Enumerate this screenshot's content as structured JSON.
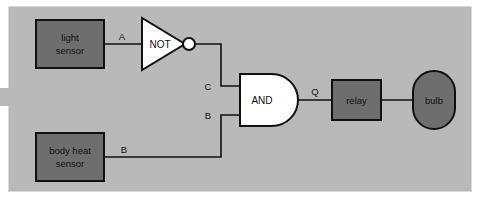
{
  "diagram": {
    "colors": {
      "panel_background": "#b9b9b9",
      "page_background": "#ffffff",
      "panel_border": "#d8d8d8",
      "component_fill": "#6e6e6e",
      "component_border": "#101010",
      "gate_fill": "#ffffff",
      "gate_border": "#101010",
      "wire": "#101010",
      "text": "#101010"
    },
    "components": {
      "light_sensor": {
        "label_line1": "light",
        "label_line2": "sensor"
      },
      "body_heat_sensor": {
        "label_line1": "body heat",
        "label_line2": "sensor"
      },
      "not_gate": {
        "label": "NOT"
      },
      "and_gate": {
        "label": "AND"
      },
      "relay": {
        "label": "relay"
      },
      "bulb": {
        "label": "bulb"
      }
    },
    "wire_labels": {
      "a": "A",
      "c": "C",
      "b_input": "B",
      "b_gate": "B",
      "q": "Q"
    }
  }
}
